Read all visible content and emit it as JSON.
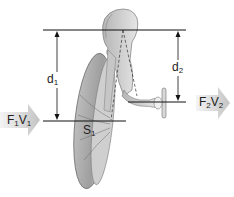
{
  "diagram": {
    "labels": {
      "d1": {
        "main": "d",
        "sub": "1"
      },
      "d2": {
        "main": "d",
        "sub": "2"
      },
      "s1": {
        "main": "S",
        "sub": "1"
      },
      "input": {
        "f": "F",
        "f_sub": "1",
        "v": "V",
        "v_sub": "1"
      },
      "output": {
        "f": "F",
        "f_sub": "2",
        "v": "V",
        "v_sub": "2"
      }
    },
    "colors": {
      "line": "#111111",
      "bone_fill": "#d8d8d8",
      "bone_shadow": "#9a9a9a",
      "arrow_fill": "#d0d0d0"
    }
  }
}
